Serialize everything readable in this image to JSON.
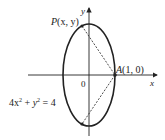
{
  "diagram": {
    "type": "ellipse-plot",
    "equation": {
      "lhs_a": "4x",
      "lhs_a_exp": "2",
      "plus": " + ",
      "lhs_b": "y",
      "lhs_b_exp": "2",
      "rhs": " = 4"
    },
    "ellipse": {
      "a": 1,
      "b": 2,
      "center": [
        0,
        0
      ]
    },
    "axes": {
      "x_label": "x",
      "y_label": "y",
      "origin_label": "0"
    },
    "points": {
      "P": {
        "name": "P",
        "coords_text": "(x, y)"
      },
      "A": {
        "name": "A",
        "coords_text": "(1, 0)",
        "x": 1,
        "y": 0
      }
    },
    "segments": [
      {
        "from": "P",
        "to": "A",
        "style": "dashed"
      },
      {
        "from": "A",
        "to": "lower-point",
        "style": "dashed"
      }
    ],
    "colors": {
      "stroke": "#222222",
      "background": "#ffffff"
    }
  }
}
